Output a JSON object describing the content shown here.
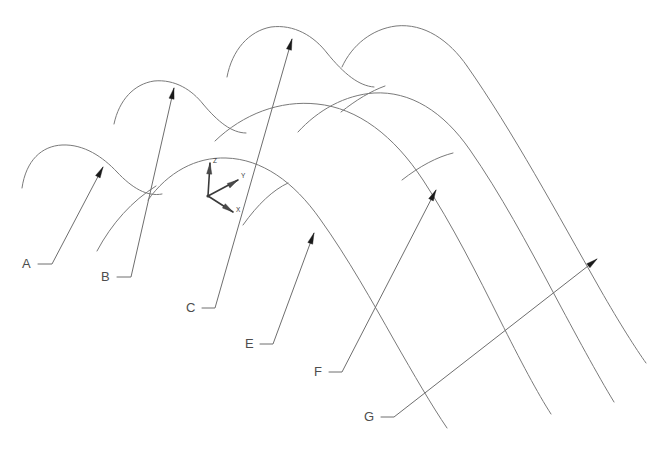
{
  "figure": {
    "kind": "cad-line-drawing",
    "background_color": "#ffffff",
    "curve_color": "#7a7a7a",
    "leader_color": "#6e6e6e",
    "arrow_color": "#1a1a1a",
    "label_color": "#4d4d4d",
    "width": 671,
    "height": 470
  },
  "callouts": [
    {
      "id": "A",
      "label": "A",
      "label_x": 22,
      "label_y": 268,
      "elbow": "M 38 264 L 52 264 L 103 167",
      "arrow_x": 103,
      "arrow_y": 167,
      "arrow_angle": -62
    },
    {
      "id": "B",
      "label": "B",
      "label_x": 101,
      "label_y": 281,
      "elbow": "M 117 277 L 131 277 L 174 88",
      "arrow_x": 174,
      "arrow_y": 88,
      "arrow_angle": -77
    },
    {
      "id": "C",
      "label": "C",
      "label_x": 186,
      "label_y": 312,
      "elbow": "M 202 308 L 215 308 L 292 39",
      "arrow_x": 292,
      "arrow_y": 39,
      "arrow_angle": -74
    },
    {
      "id": "E",
      "label": "E",
      "label_x": 245,
      "label_y": 348,
      "elbow": "M 260 344 L 273 344 L 314 233",
      "arrow_x": 314,
      "arrow_y": 233,
      "arrow_angle": -70
    },
    {
      "id": "F",
      "label": "F",
      "label_x": 314,
      "label_y": 376,
      "elbow": "M 329 372 L 342 372 L 436 190",
      "arrow_x": 436,
      "arrow_y": 190,
      "arrow_angle": -63
    },
    {
      "id": "G",
      "label": "G",
      "label_x": 364,
      "label_y": 421,
      "elbow": "M 381 417 L 394 417 L 597 259",
      "arrow_x": 597,
      "arrow_y": 259,
      "arrow_angle": -38
    }
  ],
  "axis_triad": {
    "origin_x": 208,
    "origin_y": 196,
    "axes": [
      {
        "name": "Z",
        "label": "Z",
        "tip_x": 210,
        "tip_y": 163,
        "label_x": 213,
        "label_y": 163,
        "angle": -86
      },
      {
        "name": "Y",
        "label": "Y",
        "tip_x": 238,
        "tip_y": 180,
        "label_x": 241,
        "label_y": 178,
        "angle": -31
      },
      {
        "name": "X",
        "label": "X",
        "tip_x": 233,
        "tip_y": 212,
        "label_x": 236,
        "label_y": 212,
        "angle": 34
      }
    ]
  },
  "curves": [
    {
      "name": "arch-1-left-rib",
      "d": "M 22 188 C 26 160 42 146 62 145 C 84 144 103 157 117 172"
    },
    {
      "name": "arch-1-crest",
      "d": "M 117 172 C 132 188 147 197 162 194"
    },
    {
      "name": "arch-2-left-rib",
      "d": "M 114 124 C 119 100 134 84 154 81 C 175 79 192 90 203 104"
    },
    {
      "name": "arch-2-crest",
      "d": "M 203 104 C 218 122 232 133 246 133"
    },
    {
      "name": "arch-3-left-rib",
      "d": "M 227 77 C 232 50 249 31 271 27 C 294 24 314 36 327 53"
    },
    {
      "name": "arch-3-crest",
      "d": "M 327 53 C 344 74 359 86 374 87"
    },
    {
      "name": "arch-4-outer-left",
      "d": "M 342 67 C 352 45 372 29 396 26 C 424 23 449 40 467 66"
    },
    {
      "name": "arch-4-outer-right",
      "d": "M 467 66 C 512 130 558 215 600 289 C 620 324 636 349 646 363"
    },
    {
      "name": "surface-top-rail",
      "d": "M 148 200 C 168 172 196 157 226 158 C 262 159 294 182 320 219 C 348 258 373 303 394 340 C 414 375 432 406 447 428"
    },
    {
      "name": "surface-mid-rail",
      "d": "M 215 141 C 243 114 280 100 317 104 C 358 108 394 136 423 180 C 452 224 478 276 500 320 C 520 360 538 394 551 414"
    },
    {
      "name": "surface-outer-rail",
      "d": "M 298 132 C 318 110 345 95 374 93 C 410 91 443 111 470 150 C 500 193 528 245 553 292 C 576 335 597 374 614 402"
    },
    {
      "name": "rib-crossing-left",
      "d": "M 97 251 C 112 223 132 201 156 186"
    },
    {
      "name": "rib-crossing-mid",
      "d": "M 243 225 C 258 204 273 190 288 183"
    },
    {
      "name": "rib-crossing-far",
      "d": "M 402 180 C 420 166 437 157 453 153"
    },
    {
      "name": "rib-short-upper",
      "d": "M 341 112 C 356 100 371 91 385 86"
    }
  ]
}
